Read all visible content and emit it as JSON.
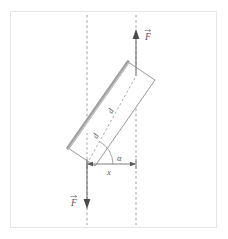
{
  "figure": {
    "canvas": {
      "width": 228,
      "height": 239,
      "background": "#ffffff"
    },
    "frame": {
      "color": "#e3e3e3",
      "x": 10,
      "y": 11,
      "width": 207,
      "height": 217
    },
    "colors": {
      "outline": "#8c8c8c",
      "shade_edge": "#9a9a9a",
      "dashed": "#9aa0a6",
      "arrow": "#6d6d6d",
      "label": "#555555",
      "frame": "#e3e3e3"
    },
    "labels": {
      "force_top": "F",
      "force_bottom": "F",
      "distance_diagonal": "d",
      "angle": "α",
      "distance_horizontal": "x"
    },
    "elements": [
      {
        "name": "bar",
        "type": "rotated-rectangle",
        "description": "tilted rectangular plate with shaded upper-left edge"
      },
      {
        "name": "force-arrow-top",
        "type": "arrow",
        "direction": "up",
        "label": "F"
      },
      {
        "name": "force-arrow-bottom",
        "type": "arrow",
        "direction": "down",
        "label": "F"
      },
      {
        "name": "dashed-line-left",
        "type": "vertical-dashed-line"
      },
      {
        "name": "dashed-line-right",
        "type": "vertical-dashed-line"
      },
      {
        "name": "diagonal-dimension",
        "type": "dashed-dimension",
        "label": "d"
      },
      {
        "name": "angle-arc",
        "type": "arc",
        "label": "α"
      },
      {
        "name": "horizontal-dimension",
        "type": "double-arrow",
        "label": "x"
      }
    ]
  }
}
